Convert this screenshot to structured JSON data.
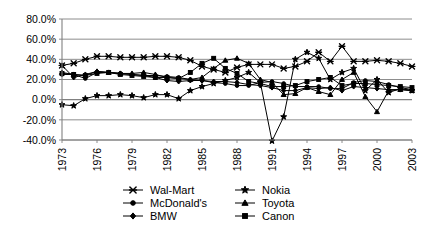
{
  "chart_data": {
    "type": "line",
    "title": "",
    "subtitle": "",
    "xlabel": "",
    "ylabel": "",
    "xlim": [
      1973,
      2003
    ],
    "ylim": [
      -40,
      80
    ],
    "ytick_labels": [
      "80.0%",
      "60.0%",
      "40.0%",
      "20.0%",
      "0.0%",
      "-20.0%",
      "-40.0%"
    ],
    "ytick_values": [
      80,
      60,
      40,
      20,
      0,
      -20,
      -40
    ],
    "xtick_labels": [
      "1973",
      "1976",
      "1979",
      "1982",
      "1985",
      "1988",
      "1991",
      "1994",
      "1997",
      "2000",
      "2003"
    ],
    "xtick_values": [
      1973,
      1976,
      1979,
      1982,
      1985,
      1988,
      1991,
      1994,
      1997,
      2000,
      2003
    ],
    "grid": true,
    "grid_axis": "y",
    "legend_position": "bottom",
    "x": [
      1973,
      1974,
      1975,
      1976,
      1977,
      1978,
      1979,
      1980,
      1981,
      1982,
      1983,
      1984,
      1985,
      1986,
      1987,
      1988,
      1989,
      1990,
      1991,
      1992,
      1993,
      1994,
      1995,
      1996,
      1997,
      1998,
      1999,
      2000,
      2001,
      2002,
      2003
    ],
    "series": [
      {
        "name": "Wal-Mart",
        "marker": "x",
        "color": "#000000",
        "values": [
          34,
          36,
          40,
          43,
          43,
          42,
          42,
          42,
          43,
          43,
          42,
          39,
          33,
          30,
          27,
          32,
          35,
          35,
          35,
          31,
          33,
          38,
          47,
          38,
          53,
          38,
          38,
          39,
          38,
          36,
          33
        ]
      },
      {
        "name": "McDonald's",
        "marker": "circle",
        "color": "#000000",
        "values": [
          25,
          25,
          21,
          27,
          27,
          26,
          25,
          24,
          24,
          23,
          22,
          20,
          19,
          17,
          16,
          14,
          14,
          17,
          18,
          16,
          13,
          13,
          13,
          11,
          11,
          17,
          19,
          18,
          15,
          12,
          10
        ]
      },
      {
        "name": "BMW",
        "marker": "diamond",
        "color": "#000000",
        "values": [
          34,
          22,
          25,
          28,
          27,
          26,
          25,
          24,
          22,
          19,
          18,
          19,
          19,
          18,
          18,
          17,
          15,
          14,
          12,
          9,
          9,
          12,
          11,
          12,
          9,
          13,
          12,
          11,
          10,
          10,
          9
        ]
      },
      {
        "name": "Nokia",
        "marker": "star",
        "color": "#000000",
        "values": [
          -5,
          -6,
          1,
          4,
          4,
          5,
          4,
          2,
          5,
          5,
          1,
          9,
          13,
          16,
          19,
          22,
          27,
          17,
          -41,
          -17,
          40,
          47,
          41,
          20,
          27,
          31,
          9,
          20,
          7,
          11,
          9
        ]
      },
      {
        "name": "Toyota",
        "marker": "triangle",
        "color": "#000000",
        "values": [
          27,
          25,
          24,
          28,
          27,
          26,
          26,
          27,
          25,
          22,
          21,
          20,
          22,
          31,
          39,
          41,
          36,
          20,
          17,
          5,
          6,
          12,
          8,
          5,
          20,
          27,
          3,
          -12,
          9,
          10,
          9
        ]
      },
      {
        "name": "Canon",
        "marker": "square",
        "color": "#000000",
        "values": [
          26,
          25,
          24,
          26,
          27,
          25,
          24,
          23,
          22,
          22,
          21,
          27,
          36,
          41,
          31,
          26,
          18,
          16,
          13,
          13,
          14,
          18,
          20,
          22,
          14,
          16,
          16,
          15,
          14,
          13,
          12
        ]
      }
    ]
  },
  "legend": {
    "items": [
      {
        "label": "Wal-Mart",
        "marker": "x"
      },
      {
        "label": "Nokia",
        "marker": "star"
      },
      {
        "label": "McDonald's",
        "marker": "circle"
      },
      {
        "label": "Toyota",
        "marker": "triangle"
      },
      {
        "label": "BMW",
        "marker": "diamond"
      },
      {
        "label": "Canon",
        "marker": "square"
      }
    ]
  },
  "style": {
    "axis_color": "#808080",
    "grid_color": "#808080",
    "plot_background": "#ffffff",
    "series_color": "#000000"
  }
}
